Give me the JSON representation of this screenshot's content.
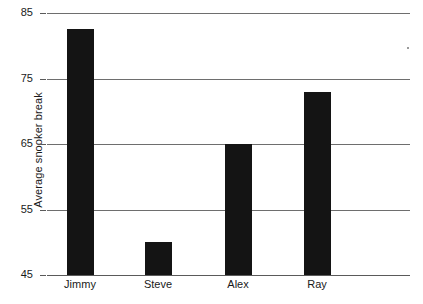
{
  "chart_data": {
    "type": "bar",
    "title": "",
    "xlabel": "",
    "ylabel": "Average snooker break",
    "categories": [
      "Jimmy",
      "Steve",
      "Alex",
      "Ray"
    ],
    "values": [
      82.5,
      50,
      65,
      73
    ],
    "ylim": [
      45,
      85
    ],
    "yticks": [
      45,
      55,
      65,
      75,
      85
    ],
    "ytick_labels": [
      "45",
      "55",
      "65",
      "75",
      "85"
    ],
    "grid": true,
    "legend": "none",
    "bar_color": "#141414",
    "gridline_color": "#6e6e6e",
    "background_color": "#ffffff"
  },
  "axis": {
    "y_title": "Average snooker break",
    "ticks": [
      {
        "label": "85",
        "value": 85
      },
      {
        "label": "75",
        "value": 75
      },
      {
        "label": "65",
        "value": 65
      },
      {
        "label": "55",
        "value": 55
      },
      {
        "label": "45",
        "value": 45
      }
    ]
  },
  "bars": [
    {
      "label": "Jimmy",
      "value": 82.5
    },
    {
      "label": "Steve",
      "value": 50
    },
    {
      "label": "Alex",
      "value": 65
    },
    {
      "label": "Ray",
      "value": 73
    }
  ]
}
